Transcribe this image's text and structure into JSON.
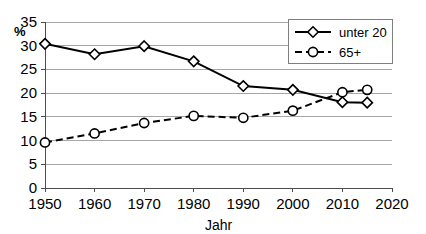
{
  "chart_data": {
    "type": "line",
    "title": "",
    "xlabel": "Jahr",
    "ylabel": "",
    "unit_label": "%",
    "x": [
      1950,
      1960,
      1970,
      1980,
      1990,
      2000,
      2010,
      2015
    ],
    "xlim": [
      1950,
      2020
    ],
    "ylim": [
      0,
      35
    ],
    "xticks": [
      "1950",
      "1960",
      "1970",
      "1980",
      "1990",
      "2000",
      "2010",
      "2020"
    ],
    "xtick_values": [
      1950,
      1960,
      1970,
      1980,
      1990,
      2000,
      2010,
      2020
    ],
    "yticks": [
      "0",
      "5",
      "10",
      "15",
      "20",
      "25",
      "30",
      "35"
    ],
    "ytick_values": [
      0,
      5,
      10,
      15,
      20,
      25,
      30,
      35
    ],
    "grid": "horizontal",
    "legend_position": "top-right",
    "series": [
      {
        "name": "unter 20",
        "style": "solid",
        "marker": "diamond",
        "color": "#000000",
        "values": [
          30.4,
          28.2,
          29.9,
          26.7,
          21.5,
          20.7,
          18.1,
          18.0
        ]
      },
      {
        "name": "65+",
        "style": "dashed",
        "marker": "circle",
        "color": "#000000",
        "values": [
          9.6,
          11.5,
          13.7,
          15.2,
          14.8,
          16.3,
          20.2,
          20.7
        ]
      }
    ]
  }
}
